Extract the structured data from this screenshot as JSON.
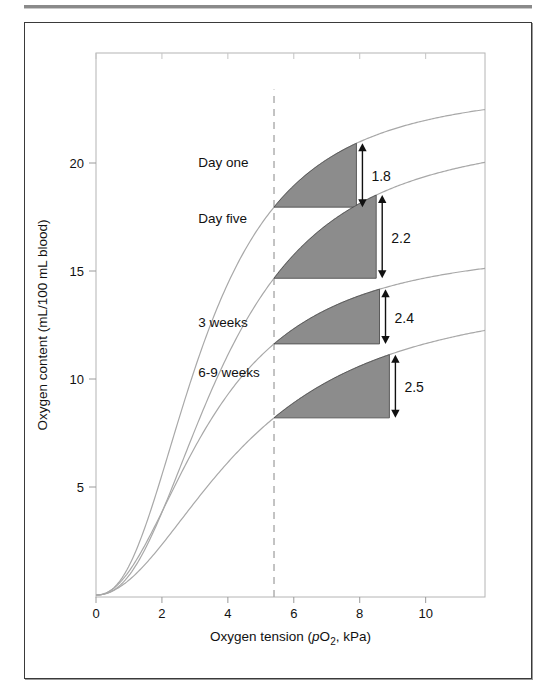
{
  "figure": {
    "border_color": "#3a3a3a",
    "background": "#ffffff"
  },
  "chart_data": {
    "type": "line",
    "title": "",
    "xlabel": "Oxygen tension (pO2, kPa)",
    "xlabel_parts": {
      "pre": "Oxygen tension (",
      "italic": "p",
      "o": "O",
      "sub": "2",
      "post": ", kPa)"
    },
    "ylabel": "Oxygen content (mL/100 mL blood)",
    "xlim": [
      0,
      11.8
    ],
    "ylim": [
      0,
      24.6
    ],
    "xticks": [
      0,
      2,
      4,
      6,
      8,
      10
    ],
    "xticklabels": [
      "0",
      "2",
      "4",
      "6",
      "8",
      "10"
    ],
    "yticks": [
      5,
      10,
      15,
      20
    ],
    "yticklabels": [
      "5",
      "10",
      "15",
      "20"
    ],
    "grid": false,
    "legend": "inline-annotations",
    "reference_line": {
      "x": 5.4,
      "style": "dashed",
      "color": "#aaaaaa"
    },
    "series": [
      {
        "name": "Day one",
        "label": "Day one",
        "plateau": 23.6,
        "p50": 3.3,
        "hill": 2.35,
        "label_x": 3.1,
        "label_y": 19.8
      },
      {
        "name": "Day five",
        "label": "Day five",
        "plateau": 21.6,
        "p50": 3.9,
        "hill": 2.3,
        "label_x": 3.1,
        "label_y": 17.2
      },
      {
        "name": "3 weeks",
        "label": "3 weeks",
        "plateau": 16.3,
        "p50": 3.5,
        "hill": 2.1,
        "label_x": 3.1,
        "label_y": 12.4
      },
      {
        "name": "6-9 weeks",
        "label": "6-9 weeks",
        "plateau": 14.2,
        "p50": 4.6,
        "hill": 1.95,
        "label_x": 3.1,
        "label_y": 10.1
      }
    ],
    "delivery_bands": [
      {
        "series": "Day one",
        "value": "1.8",
        "value_num": 1.8,
        "x_start": 5.4,
        "x_end": 7.9,
        "top": 23.0,
        "bottom": 21.9
      },
      {
        "series": "Day five",
        "value": "2.2",
        "value_num": 2.2,
        "x_start": 5.4,
        "x_end": 8.5,
        "top": 21.0,
        "bottom": 19.1
      },
      {
        "series": "3 weeks",
        "value": "2.4",
        "value_num": 2.4,
        "x_start": 5.4,
        "x_end": 8.6,
        "top": 15.9,
        "bottom": 14.0
      },
      {
        "series": "6-9 weeks",
        "value": "2.5",
        "value_num": 2.5,
        "x_start": 5.4,
        "x_end": 8.9,
        "top": 13.8,
        "bottom": 11.6
      }
    ],
    "shade_color": "#8c8c8c",
    "curve_color": "#a8a8a8"
  }
}
